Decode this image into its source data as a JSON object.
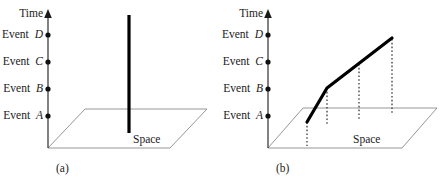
{
  "figure": {
    "panels": [
      {
        "id": "a",
        "caption": "(a)",
        "axis_label": "Time",
        "plane_label": "Space",
        "events": [
          {
            "key": "D",
            "prefix": "Event",
            "name": "D"
          },
          {
            "key": "C",
            "prefix": "Event",
            "name": "C"
          },
          {
            "key": "B",
            "prefix": "Event",
            "name": "B"
          },
          {
            "key": "A",
            "prefix": "Event",
            "name": "A"
          }
        ],
        "worldline": "vertical-stationary"
      },
      {
        "id": "b",
        "caption": "(b)",
        "axis_label": "Time",
        "plane_label": "Space",
        "events": [
          {
            "key": "D",
            "prefix": "Event",
            "name": "D"
          },
          {
            "key": "C",
            "prefix": "Event",
            "name": "C"
          },
          {
            "key": "B",
            "prefix": "Event",
            "name": "B"
          },
          {
            "key": "A",
            "prefix": "Event",
            "name": "A"
          }
        ],
        "worldline": "bent-moving"
      }
    ],
    "colors": {
      "ink": "#000000",
      "text": "#1a1a1a",
      "plane_outline": "#8a8a8a",
      "worldline": "#000000",
      "dropline": "#3a3a3a"
    }
  },
  "labels": {
    "time_a": "Time",
    "space_a": "Space",
    "caption_a": "(a)",
    "time_b": "Time",
    "space_b": "Space",
    "caption_b": "(b)",
    "event_a_d_prefix": "Event",
    "event_a_d_name": "D",
    "event_a_c_prefix": "Event",
    "event_a_c_name": "C",
    "event_a_b_prefix": "Event",
    "event_a_b_name": "B",
    "event_a_a_prefix": "Event",
    "event_a_a_name": "A",
    "event_b_d_prefix": "Event",
    "event_b_d_name": "D",
    "event_b_c_prefix": "Event",
    "event_b_c_name": "C",
    "event_b_b_prefix": "Event",
    "event_b_b_name": "B",
    "event_b_a_prefix": "Event",
    "event_b_a_name": "A"
  }
}
